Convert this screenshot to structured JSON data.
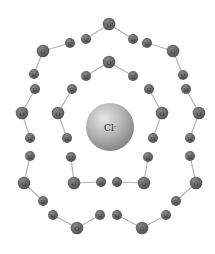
{
  "diagram": {
    "title": "",
    "center_ion": {
      "label": "Cl",
      "charge": "-",
      "x": 110,
      "y": 127,
      "r": 24
    },
    "colors": {
      "atom": "#5e5e5e",
      "atom_highlight": "#8a8a8a",
      "bond": "#b4b4b4",
      "ion_light": "#e2e2e2",
      "ion_dark": "#8c8c8c",
      "label": "#2a2a2a"
    },
    "atoms": [
      {
        "id": "o1",
        "el": "O",
        "x": 109,
        "y": 24
      },
      {
        "id": "h1",
        "el": "H",
        "x": 86,
        "y": 39
      },
      {
        "id": "h2",
        "el": "H",
        "x": 133,
        "y": 39
      },
      {
        "id": "h3",
        "el": "H",
        "x": 70,
        "y": 43
      },
      {
        "id": "o2",
        "el": "O",
        "x": 43,
        "y": 51
      },
      {
        "id": "h4",
        "el": "H",
        "x": 147,
        "y": 43
      },
      {
        "id": "o3",
        "el": "O",
        "x": 173,
        "y": 51
      },
      {
        "id": "h5",
        "el": "H",
        "x": 34,
        "y": 74
      },
      {
        "id": "h6",
        "el": "H",
        "x": 183,
        "y": 75
      },
      {
        "id": "h7",
        "el": "H",
        "x": 35,
        "y": 89
      },
      {
        "id": "h8",
        "el": "H",
        "x": 186,
        "y": 89
      },
      {
        "id": "o4",
        "el": "O",
        "x": 22,
        "y": 113
      },
      {
        "id": "o5",
        "el": "O",
        "x": 199,
        "y": 113
      },
      {
        "id": "o6",
        "el": "O",
        "x": 109,
        "y": 62
      },
      {
        "id": "h9",
        "el": "H",
        "x": 86,
        "y": 76
      },
      {
        "id": "h10",
        "el": "H",
        "x": 133,
        "y": 76
      },
      {
        "id": "h11",
        "el": "H",
        "x": 72,
        "y": 89
      },
      {
        "id": "h12",
        "el": "H",
        "x": 149,
        "y": 89
      },
      {
        "id": "o7",
        "el": "O",
        "x": 58,
        "y": 113
      },
      {
        "id": "o8",
        "el": "O",
        "x": 162,
        "y": 113
      },
      {
        "id": "h13",
        "el": "H",
        "x": 30,
        "y": 138
      },
      {
        "id": "h14",
        "el": "H",
        "x": 67,
        "y": 138
      },
      {
        "id": "h15",
        "el": "H",
        "x": 153,
        "y": 138
      },
      {
        "id": "h16",
        "el": "H",
        "x": 190,
        "y": 138
      },
      {
        "id": "h17",
        "el": "H",
        "x": 30,
        "y": 156
      },
      {
        "id": "h18",
        "el": "H",
        "x": 71,
        "y": 157
      },
      {
        "id": "h19",
        "el": "H",
        "x": 148,
        "y": 157
      },
      {
        "id": "h20",
        "el": "H",
        "x": 190,
        "y": 156
      },
      {
        "id": "o9",
        "el": "O",
        "x": 24,
        "y": 183
      },
      {
        "id": "o10",
        "el": "O",
        "x": 74,
        "y": 183
      },
      {
        "id": "h21",
        "el": "H",
        "x": 101,
        "y": 182
      },
      {
        "id": "h22",
        "el": "H",
        "x": 117,
        "y": 182
      },
      {
        "id": "o11",
        "el": "O",
        "x": 144,
        "y": 183
      },
      {
        "id": "o12",
        "el": "O",
        "x": 196,
        "y": 183
      },
      {
        "id": "h23",
        "el": "H",
        "x": 43,
        "y": 201
      },
      {
        "id": "h24",
        "el": "H",
        "x": 176,
        "y": 201
      },
      {
        "id": "h25",
        "el": "H",
        "x": 53,
        "y": 215
      },
      {
        "id": "h26",
        "el": "H",
        "x": 100,
        "y": 215
      },
      {
        "id": "h27",
        "el": "H",
        "x": 117,
        "y": 215
      },
      {
        "id": "h28",
        "el": "H",
        "x": 166,
        "y": 215
      },
      {
        "id": "o13",
        "el": "O",
        "x": 77,
        "y": 228
      },
      {
        "id": "o14",
        "el": "O",
        "x": 142,
        "y": 228
      }
    ],
    "bonds": [
      [
        "o1",
        "h1"
      ],
      [
        "o1",
        "h2"
      ],
      [
        "o2",
        "h3"
      ],
      [
        "o2",
        "h5"
      ],
      [
        "o3",
        "h4"
      ],
      [
        "o3",
        "h6"
      ],
      [
        "o4",
        "h7"
      ],
      [
        "o4",
        "h13"
      ],
      [
        "o5",
        "h8"
      ],
      [
        "o5",
        "h16"
      ],
      [
        "o6",
        "h9"
      ],
      [
        "o6",
        "h10"
      ],
      [
        "o7",
        "h11"
      ],
      [
        "o7",
        "h14"
      ],
      [
        "o8",
        "h12"
      ],
      [
        "o8",
        "h15"
      ],
      [
        "o9",
        "h17"
      ],
      [
        "o9",
        "h23"
      ],
      [
        "o10",
        "h18"
      ],
      [
        "o10",
        "h21"
      ],
      [
        "o11",
        "h22"
      ],
      [
        "o11",
        "h19"
      ],
      [
        "o12",
        "h20"
      ],
      [
        "o12",
        "h24"
      ],
      [
        "o13",
        "h25"
      ],
      [
        "o13",
        "h26"
      ],
      [
        "o14",
        "h27"
      ],
      [
        "o14",
        "h28"
      ]
    ]
  }
}
